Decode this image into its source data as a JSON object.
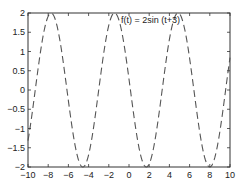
{
  "chart_data": {
    "type": "line",
    "title": "",
    "annotation": "f(t) = 2sin (t+3)",
    "xlabel": "",
    "ylabel": "",
    "xlim": [
      -10,
      10
    ],
    "ylim": [
      -2,
      2
    ],
    "xticks": [
      -10,
      -8,
      -6,
      -4,
      -2,
      0,
      2,
      4,
      6,
      8,
      10
    ],
    "yticks": [
      -2,
      -1.5,
      -1,
      -0.5,
      0,
      0.5,
      1,
      1.5,
      2
    ],
    "grid": false,
    "series": [
      {
        "name": "f(t) = 2sin (t+3)",
        "function": "2*sin(t+3)",
        "style": "dashed",
        "color": "#555555"
      }
    ]
  },
  "labels": {
    "annotation": "f(t) = 2sin (t+3)"
  }
}
